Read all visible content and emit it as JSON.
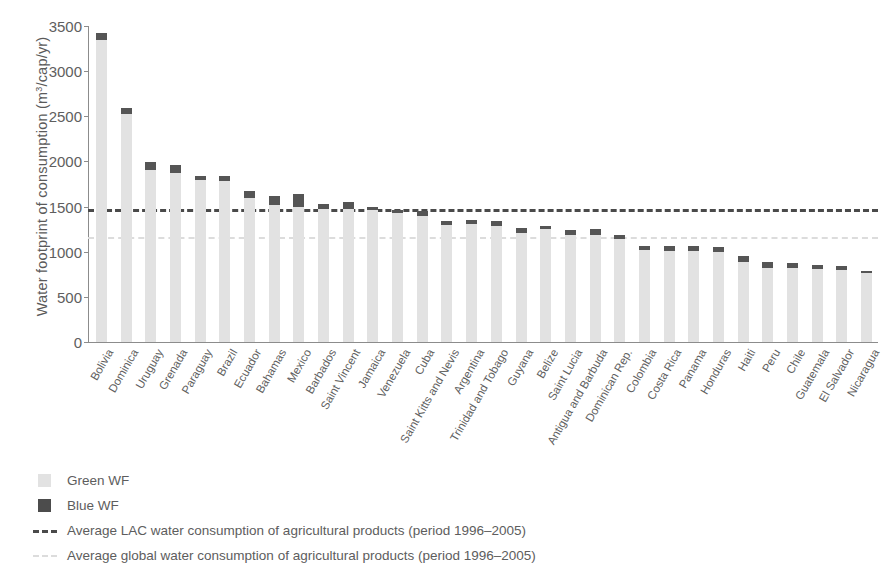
{
  "chart_data": {
    "type": "bar",
    "stacked": true,
    "title": "",
    "xlabel": "",
    "ylabel": "Water footprint of consumption (m3/cap/yr)",
    "ylabel_html": "Water footprint of consumption (m³/cap/yr)",
    "ylim": [
      0,
      3500
    ],
    "ytick_labels": [
      "3500",
      "3000",
      "2500",
      "2000",
      "1500",
      "1000",
      "500",
      "0"
    ],
    "ytick_values": [
      3500,
      3000,
      2500,
      2000,
      1500,
      1000,
      500,
      0
    ],
    "grid": false,
    "legend_position": "below-plot-left",
    "categories": [
      "Bolivia",
      "Dominica",
      "Uruguay",
      "Grenada",
      "Paraguay",
      "Brazil",
      "Ecuador",
      "Bahamas",
      "Mexico",
      "Barbados",
      "Saint Vincent",
      "Jamaica",
      "Venezuela",
      "Cuba",
      "Saint Kitts and Nevis",
      "Argentina",
      "Trinidad and Tobago",
      "Guyana",
      "Belize",
      "Saint Lucia",
      "Antigua and Barbuda",
      "Dominican Rep.",
      "Colombia",
      "Costa Rica",
      "Panama",
      "Honduras",
      "Haiti",
      "Peru",
      "Chile",
      "Guatemala",
      "El Salvador",
      "Nicaragua"
    ],
    "series": [
      {
        "name": "Green WF",
        "color": "#e2e2e2",
        "values": [
          3340,
          2530,
          1910,
          1870,
          1790,
          1780,
          1590,
          1520,
          1490,
          1470,
          1470,
          1460,
          1430,
          1400,
          1300,
          1310,
          1290,
          1210,
          1250,
          1190,
          1190,
          1140,
          1020,
          1010,
          1010,
          1000,
          890,
          820,
          820,
          810,
          800,
          760
        ]
      },
      {
        "name": "Blue WF",
        "color": "#555555",
        "values": [
          80,
          60,
          80,
          90,
          50,
          60,
          80,
          100,
          150,
          60,
          80,
          40,
          30,
          50,
          40,
          40,
          50,
          50,
          40,
          50,
          60,
          40,
          40,
          50,
          50,
          50,
          60,
          70,
          50,
          40,
          40,
          30
        ]
      }
    ],
    "totals": [
      3420,
      2590,
      1990,
      1960,
      1840,
      1840,
      1670,
      1620,
      1640,
      1530,
      1550,
      1500,
      1460,
      1450,
      1340,
      1350,
      1340,
      1260,
      1290,
      1240,
      1250,
      1180,
      1060,
      1060,
      1060,
      1050,
      950,
      890,
      870,
      850,
      840,
      790
    ],
    "reference_lines": [
      {
        "id": "lac",
        "value": 1470,
        "label": "Average LAC water consumption of agricultural products (period 1996–2005)",
        "color": "#4a4a4a",
        "style": "dashed"
      },
      {
        "id": "global",
        "value": 1160,
        "label": "Average global water consumption of agricultural products (period 1996–2005)",
        "color": "#dcdcdc",
        "style": "dashed"
      }
    ]
  },
  "legend": {
    "items": [
      {
        "label": "Green WF",
        "kind": "swatch",
        "swatch": "green"
      },
      {
        "label": "Blue WF",
        "kind": "swatch",
        "swatch": "blue"
      },
      {
        "label": "Average LAC water consumption of agricultural products (period 1996–2005)",
        "kind": "line",
        "line": "lac"
      },
      {
        "label": "Average global water consumption of agricultural products (period 1996–2005)",
        "kind": "line",
        "line": "glob"
      }
    ]
  },
  "colors": {
    "green_wf": "#e2e2e2",
    "blue_wf": "#555555",
    "lac_line": "#4a4a4a",
    "global_line": "#dcdcdc",
    "axis": "#8c8c8c",
    "text": "#5d5d5d"
  }
}
